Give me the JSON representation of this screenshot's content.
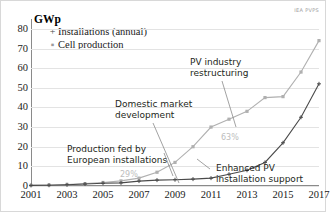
{
  "watermark": "IEA PVPS",
  "axis_title": "GWp",
  "legend": {
    "items": [
      {
        "label": "Installations (annual)",
        "marker": "+",
        "color": "#4a4a4a"
      },
      {
        "label": "Cell production",
        "marker": "▪",
        "color": "#9b9b9b"
      }
    ]
  },
  "annotations": [
    {
      "id": "domestic-market",
      "line1": "Domestic market",
      "line2": "development"
    },
    {
      "id": "pv-industry",
      "line1": "PV industry",
      "line2": "restructuring"
    },
    {
      "id": "production-fed",
      "line1": "Production fed by",
      "line2": "European installations"
    },
    {
      "id": "enhanced-pv",
      "line1": "Enhanced PV",
      "line2": "installation support"
    }
  ],
  "data_labels": [
    {
      "id": "pct-29",
      "text": "29%"
    },
    {
      "id": "pct-63",
      "text": "63%"
    }
  ],
  "chart_data": {
    "type": "line",
    "title": "",
    "subtitle": "",
    "xlabel": "",
    "ylabel": "GWp",
    "ylim": [
      0,
      85
    ],
    "xlim": [
      2001,
      2017
    ],
    "grid": true,
    "legend_position": "top-left",
    "yticks": [
      0,
      10,
      20,
      30,
      40,
      50,
      60,
      70,
      80
    ],
    "xticks": [
      2001,
      2003,
      2005,
      2007,
      2009,
      2011,
      2013,
      2015,
      2017
    ],
    "x": [
      2001,
      2002,
      2003,
      2004,
      2005,
      2006,
      2007,
      2008,
      2009,
      2010,
      2011,
      2012,
      2013,
      2014,
      2015,
      2016,
      2017
    ],
    "series": [
      {
        "name": "Cell production",
        "color": "#b0b0b0",
        "marker": "square",
        "values": [
          0.3,
          0.5,
          0.8,
          1.2,
          1.8,
          2.6,
          4.0,
          7.0,
          12.0,
          20.0,
          30.0,
          34.0,
          38.0,
          45.0,
          45.5,
          58.0,
          74.0
        ]
      },
      {
        "name": "Installations (annual)",
        "color": "#4a4a4a",
        "marker": "plus",
        "values": [
          0.3,
          0.4,
          0.6,
          1.0,
          1.4,
          1.6,
          2.5,
          3.0,
          3.2,
          3.5,
          4.0,
          6.0,
          8.0,
          12.0,
          22.0,
          35.0,
          52.0
        ]
      }
    ],
    "annotation_values": [
      {
        "label": "29%",
        "near_x": 2007,
        "near_series": "Cell production"
      },
      {
        "label": "63%",
        "near_x": 2013,
        "near_series": "Cell production"
      }
    ]
  }
}
